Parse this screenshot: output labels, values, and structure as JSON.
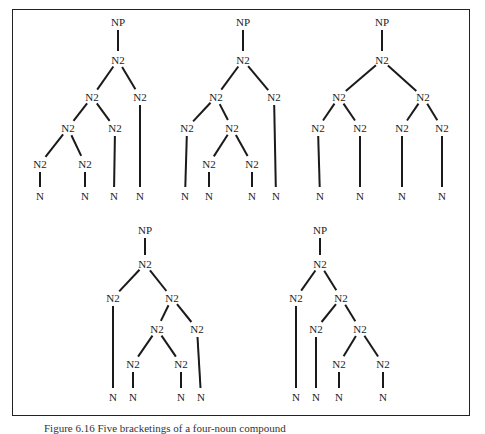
{
  "figure": {
    "caption": "Figure 6.16  Five bracketings of a four-noun compound",
    "labels": {
      "root": "NP",
      "internal": "N2",
      "leaf": "N"
    },
    "trees": [
      {
        "id": "tree-1",
        "nodes": [
          {
            "id": "np",
            "label": "NP",
            "x": 118,
            "y": 22
          },
          {
            "id": "a",
            "label": "N2",
            "x": 118,
            "y": 60
          },
          {
            "id": "b",
            "label": "N2",
            "x": 92,
            "y": 97
          },
          {
            "id": "c",
            "label": "N2",
            "x": 140,
            "y": 97
          },
          {
            "id": "d",
            "label": "N2",
            "x": 68,
            "y": 128
          },
          {
            "id": "e",
            "label": "N2",
            "x": 115,
            "y": 128
          },
          {
            "id": "f",
            "label": "N2",
            "x": 40,
            "y": 164
          },
          {
            "id": "g",
            "label": "N2",
            "x": 85,
            "y": 164
          },
          {
            "id": "l1",
            "label": "N",
            "x": 40,
            "y": 196
          },
          {
            "id": "l2",
            "label": "N",
            "x": 85,
            "y": 196
          },
          {
            "id": "l3",
            "label": "N",
            "x": 114,
            "y": 196
          },
          {
            "id": "l4",
            "label": "N",
            "x": 140,
            "y": 196
          }
        ],
        "edges": [
          [
            "np",
            "a"
          ],
          [
            "a",
            "b"
          ],
          [
            "a",
            "c"
          ],
          [
            "b",
            "d"
          ],
          [
            "b",
            "e"
          ],
          [
            "d",
            "f"
          ],
          [
            "d",
            "g"
          ],
          [
            "f",
            "l1"
          ],
          [
            "g",
            "l2"
          ],
          [
            "e",
            "l3"
          ],
          [
            "c",
            "l4"
          ]
        ]
      },
      {
        "id": "tree-2",
        "nodes": [
          {
            "id": "np",
            "label": "NP",
            "x": 243,
            "y": 22
          },
          {
            "id": "a",
            "label": "N2",
            "x": 243,
            "y": 60
          },
          {
            "id": "b",
            "label": "N2",
            "x": 216,
            "y": 97
          },
          {
            "id": "c",
            "label": "N2",
            "x": 274,
            "y": 97
          },
          {
            "id": "d",
            "label": "N2",
            "x": 187,
            "y": 128
          },
          {
            "id": "e",
            "label": "N2",
            "x": 232,
            "y": 128
          },
          {
            "id": "f",
            "label": "N2",
            "x": 209,
            "y": 164
          },
          {
            "id": "g",
            "label": "N2",
            "x": 252,
            "y": 164
          },
          {
            "id": "l1",
            "label": "N",
            "x": 185,
            "y": 196
          },
          {
            "id": "l2",
            "label": "N",
            "x": 209,
            "y": 196
          },
          {
            "id": "l3",
            "label": "N",
            "x": 252,
            "y": 196
          },
          {
            "id": "l4",
            "label": "N",
            "x": 276,
            "y": 196
          }
        ],
        "edges": [
          [
            "np",
            "a"
          ],
          [
            "a",
            "b"
          ],
          [
            "a",
            "c"
          ],
          [
            "b",
            "d"
          ],
          [
            "b",
            "e"
          ],
          [
            "e",
            "f"
          ],
          [
            "e",
            "g"
          ],
          [
            "d",
            "l1"
          ],
          [
            "f",
            "l2"
          ],
          [
            "g",
            "l3"
          ],
          [
            "c",
            "l4"
          ]
        ]
      },
      {
        "id": "tree-3",
        "nodes": [
          {
            "id": "np",
            "label": "NP",
            "x": 382,
            "y": 22
          },
          {
            "id": "a",
            "label": "N2",
            "x": 382,
            "y": 60
          },
          {
            "id": "b",
            "label": "N2",
            "x": 339,
            "y": 97
          },
          {
            "id": "c",
            "label": "N2",
            "x": 423,
            "y": 97
          },
          {
            "id": "d",
            "label": "N2",
            "x": 318,
            "y": 128
          },
          {
            "id": "e",
            "label": "N2",
            "x": 360,
            "y": 128
          },
          {
            "id": "f",
            "label": "N2",
            "x": 402,
            "y": 128
          },
          {
            "id": "g",
            "label": "N2",
            "x": 442,
            "y": 128
          },
          {
            "id": "l1",
            "label": "N",
            "x": 320,
            "y": 196
          },
          {
            "id": "l2",
            "label": "N",
            "x": 360,
            "y": 196
          },
          {
            "id": "l3",
            "label": "N",
            "x": 402,
            "y": 196
          },
          {
            "id": "l4",
            "label": "N",
            "x": 442,
            "y": 196
          }
        ],
        "edges": [
          [
            "np",
            "a"
          ],
          [
            "a",
            "b"
          ],
          [
            "a",
            "c"
          ],
          [
            "b",
            "d"
          ],
          [
            "b",
            "e"
          ],
          [
            "c",
            "f"
          ],
          [
            "c",
            "g"
          ],
          [
            "d",
            "l1"
          ],
          [
            "e",
            "l2"
          ],
          [
            "f",
            "l3"
          ],
          [
            "g",
            "l4"
          ]
        ]
      },
      {
        "id": "tree-4",
        "nodes": [
          {
            "id": "np",
            "label": "NP",
            "x": 145,
            "y": 230
          },
          {
            "id": "a",
            "label": "N2",
            "x": 145,
            "y": 264
          },
          {
            "id": "b",
            "label": "N2",
            "x": 113,
            "y": 298
          },
          {
            "id": "c",
            "label": "N2",
            "x": 172,
            "y": 298
          },
          {
            "id": "d",
            "label": "N2",
            "x": 157,
            "y": 329
          },
          {
            "id": "e",
            "label": "N2",
            "x": 197,
            "y": 329
          },
          {
            "id": "f",
            "label": "N2",
            "x": 133,
            "y": 364
          },
          {
            "id": "g",
            "label": "N2",
            "x": 181,
            "y": 364
          },
          {
            "id": "l1",
            "label": "N",
            "x": 113,
            "y": 397
          },
          {
            "id": "l2",
            "label": "N",
            "x": 133,
            "y": 397
          },
          {
            "id": "l3",
            "label": "N",
            "x": 181,
            "y": 397
          },
          {
            "id": "l4",
            "label": "N",
            "x": 201,
            "y": 397
          }
        ],
        "edges": [
          [
            "np",
            "a"
          ],
          [
            "a",
            "b"
          ],
          [
            "a",
            "c"
          ],
          [
            "c",
            "d"
          ],
          [
            "c",
            "e"
          ],
          [
            "d",
            "f"
          ],
          [
            "d",
            "g"
          ],
          [
            "b",
            "l1"
          ],
          [
            "f",
            "l2"
          ],
          [
            "g",
            "l3"
          ],
          [
            "e",
            "l4"
          ]
        ]
      },
      {
        "id": "tree-5",
        "nodes": [
          {
            "id": "np",
            "label": "NP",
            "x": 320,
            "y": 230
          },
          {
            "id": "a",
            "label": "N2",
            "x": 320,
            "y": 264
          },
          {
            "id": "b",
            "label": "N2",
            "x": 296,
            "y": 298
          },
          {
            "id": "c",
            "label": "N2",
            "x": 341,
            "y": 298
          },
          {
            "id": "d",
            "label": "N2",
            "x": 316,
            "y": 329
          },
          {
            "id": "e",
            "label": "N2",
            "x": 360,
            "y": 329
          },
          {
            "id": "f",
            "label": "N2",
            "x": 339,
            "y": 364
          },
          {
            "id": "g",
            "label": "N2",
            "x": 383,
            "y": 364
          },
          {
            "id": "l1",
            "label": "N",
            "x": 296,
            "y": 397
          },
          {
            "id": "l2",
            "label": "N",
            "x": 316,
            "y": 397
          },
          {
            "id": "l3",
            "label": "N",
            "x": 339,
            "y": 397
          },
          {
            "id": "l4",
            "label": "N",
            "x": 383,
            "y": 397
          }
        ],
        "edges": [
          [
            "np",
            "a"
          ],
          [
            "a",
            "b"
          ],
          [
            "a",
            "c"
          ],
          [
            "c",
            "d"
          ],
          [
            "c",
            "e"
          ],
          [
            "e",
            "f"
          ],
          [
            "e",
            "g"
          ],
          [
            "b",
            "l1"
          ],
          [
            "d",
            "l2"
          ],
          [
            "f",
            "l3"
          ],
          [
            "g",
            "l4"
          ]
        ]
      }
    ]
  }
}
